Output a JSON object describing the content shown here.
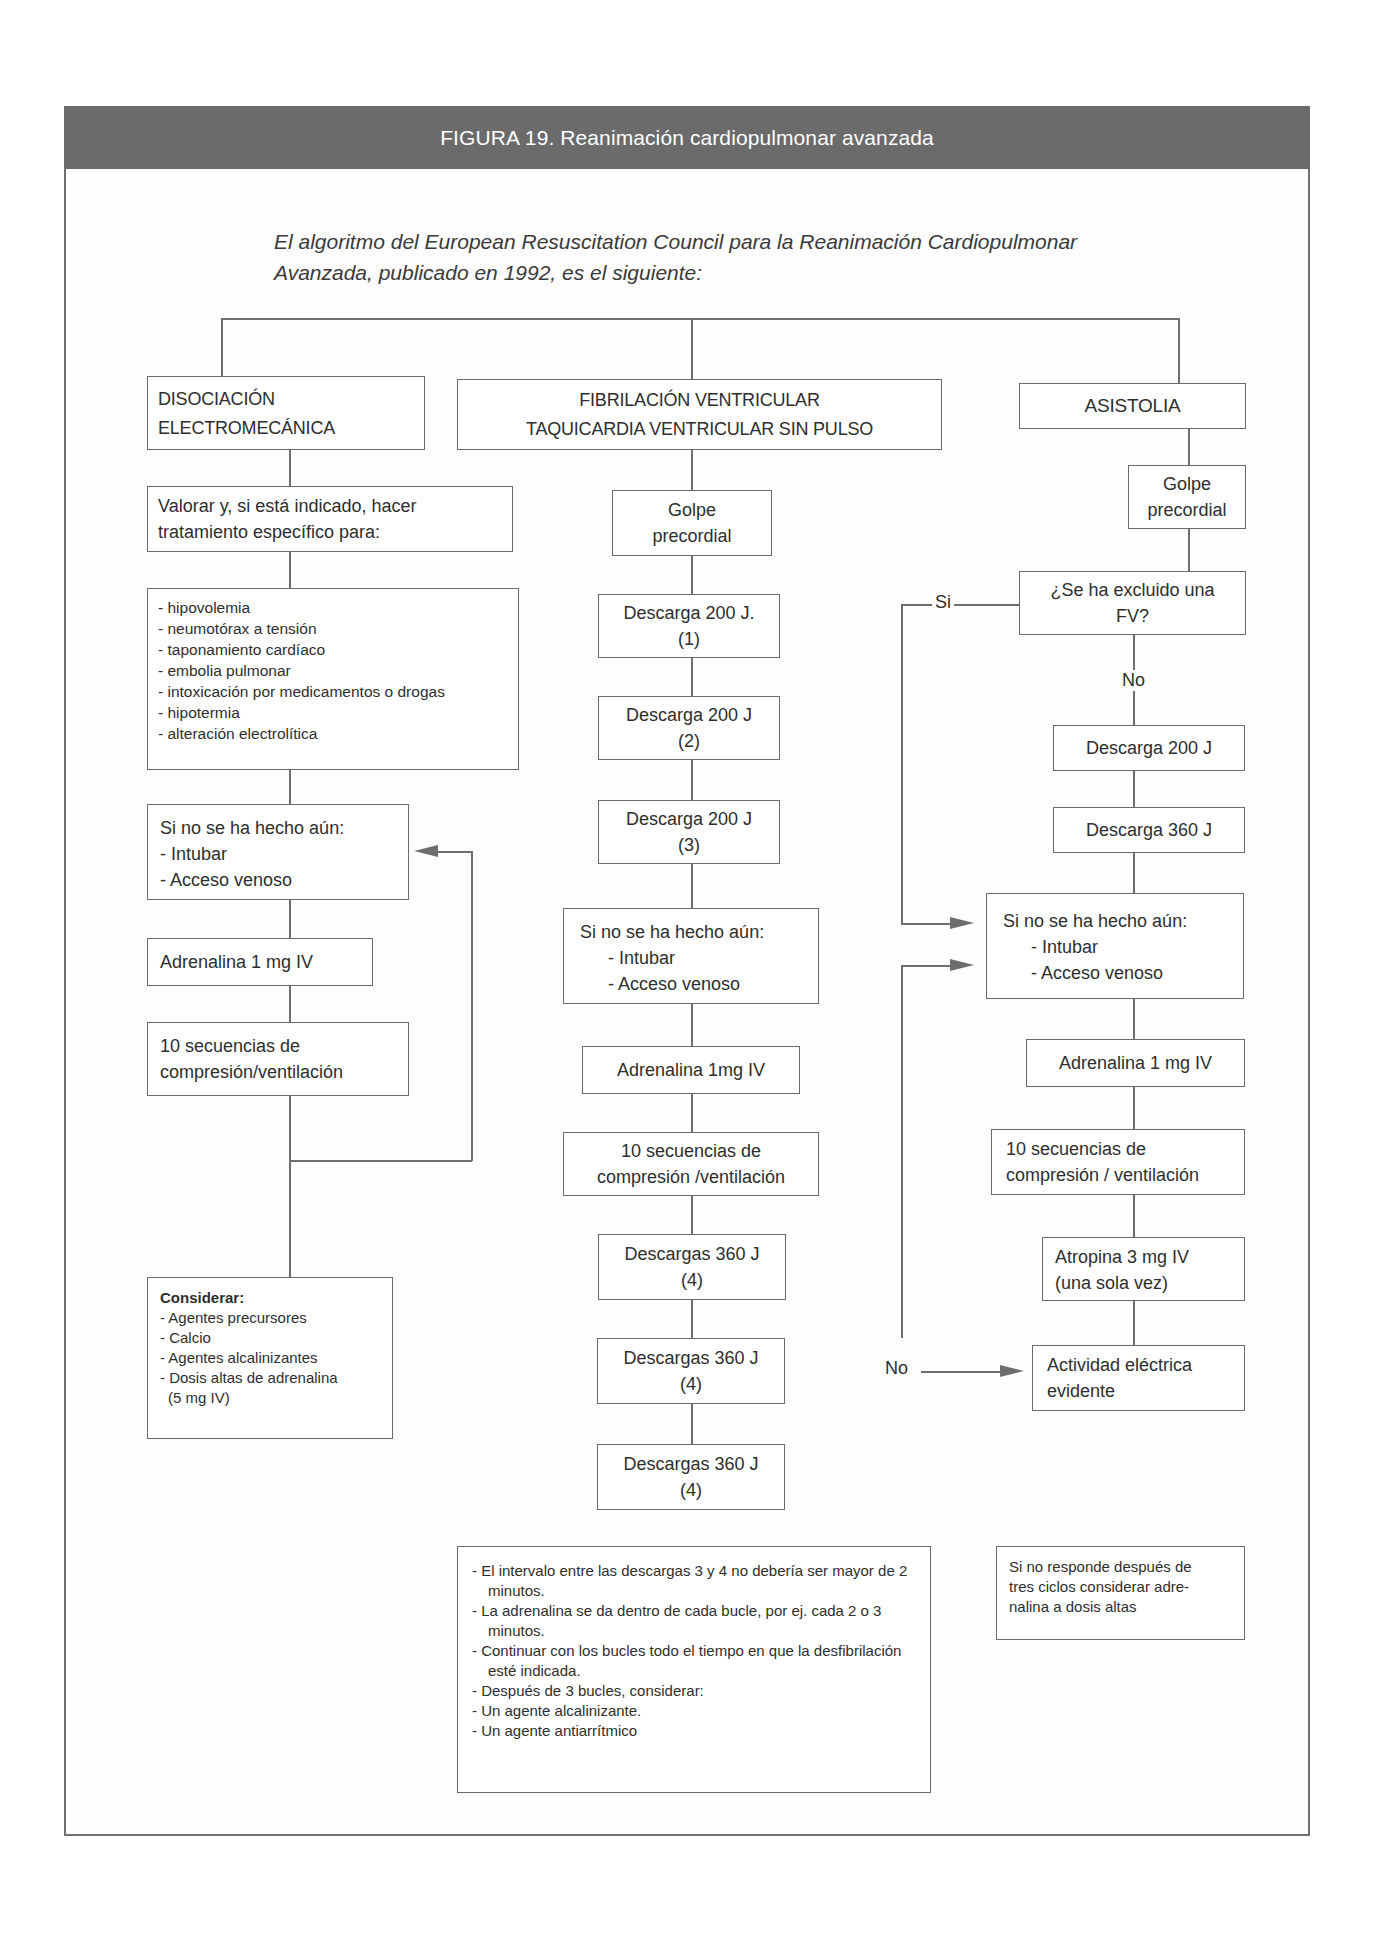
{
  "figure": {
    "title": "FIGURA 19. Reanimación cardiopulmonar avanzada",
    "intro_line1": "El algoritmo del European Resuscitation Council para la Reanimación Cardiopulmonar",
    "intro_line2": "Avanzada, publicado en 1992, es el siguiente:"
  },
  "left_branch": {
    "header_line1": "DISOCIACIÓN",
    "header_line2": "ELECTROMECÁNICA",
    "assess_line1": "Valorar y, si está indicado, hacer",
    "assess_line2": "tratamiento específico para:",
    "causes": [
      "- hipovolemia",
      "- neumotórax a tensión",
      "- taponamiento cardíaco",
      "- embolia pulmonar",
      "- intoxicación por medicamentos o drogas",
      "- hipotermia",
      "- alteración electrolítica"
    ],
    "if_not_done": {
      "title": "Si no se ha hecho aún:",
      "items": [
        "- Intubar",
        "- Acceso venoso"
      ]
    },
    "adrenaline": "Adrenalina 1 mg IV",
    "cpr_line1": "10 secuencias de",
    "cpr_line2": "compresión/ventilación",
    "consider": {
      "title": "Considerar:",
      "items": [
        "- Agentes precursores",
        "- Calcio",
        "- Agentes alcalinizantes",
        "- Dosis altas de adrenalina",
        "(5 mg IV)"
      ]
    }
  },
  "middle_branch": {
    "header_line1": "FIBRILACIÓN VENTRICULAR",
    "header_line2": "TAQUICARDIA VENTRICULAR SIN PULSO",
    "golpe_line1": "Golpe",
    "golpe_line2": "precordial",
    "shocks": [
      {
        "label": "Descarga 200 J.",
        "num": "(1)"
      },
      {
        "label": "Descarga 200 J",
        "num": "(2)"
      },
      {
        "label": "Descarga 200 J",
        "num": "(3)"
      }
    ],
    "if_not_done": {
      "title": "Si no se ha hecho aún:",
      "items": [
        "- Intubar",
        "- Acceso venoso"
      ]
    },
    "adrenaline": "Adrenalina 1mg IV",
    "cpr_line1": "10 secuencias de",
    "cpr_line2": "compresión /ventilación",
    "shocks_360": [
      {
        "label": "Descargas 360 J",
        "num": "(4)"
      },
      {
        "label": "Descargas 360 J",
        "num": "(4)"
      },
      {
        "label": "Descargas 360 J",
        "num": "(4)"
      }
    ]
  },
  "right_branch": {
    "header": "ASISTOLIA",
    "golpe_line1": "Golpe",
    "golpe_line2": "precordial",
    "question_line1": "¿Se ha excluido una",
    "question_line2": "FV?",
    "yes_label": "Si",
    "no_label": "No",
    "shock_200": "Descarga 200 J",
    "shock_360": "Descarga 360 J",
    "if_not_done": {
      "title": "Si no se ha hecho aún:",
      "items": [
        "- Intubar",
        "- Acceso venoso"
      ]
    },
    "adrenaline": "Adrenalina 1 mg IV",
    "cpr_line1": "10 secuencias de",
    "cpr_line2": "compresión / ventilación",
    "atropine_line1": "Atropina 3 mg IV",
    "atropine_line2": "(una sola vez)",
    "no_loop_label": "No",
    "activity_line1": "Actividad eléctrica",
    "activity_line2": "evidente"
  },
  "notes": {
    "middle": [
      "- El intervalo entre las descargas 3 y 4 no debería ser mayor de 2 minutos.",
      "- La adrenalina se da dentro de cada bucle, por ej. cada 2 o 3 minutos.",
      "- Continuar con los bucles todo el tiempo en que la desfibrilación esté indicada.",
      "- Después de 3 bucles, considerar:",
      "- Un agente alcalinizante.",
      "- Un agente antiarrítmico"
    ],
    "right_line1": "Si no responde después de",
    "right_line2": "tres ciclos considerar adre-",
    "right_line3": "nalina a dosis altas"
  },
  "colors": {
    "header_bar": "#6b6b6b",
    "lines": "#6e6e6e",
    "text": "#2e2e2e"
  }
}
